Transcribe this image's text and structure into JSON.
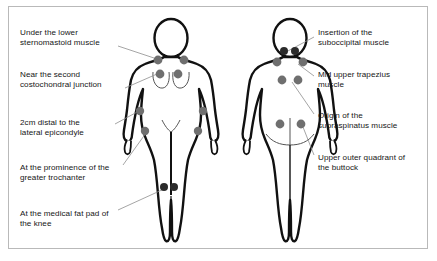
{
  "diagram": {
    "type": "anatomical-tender-point-map",
    "colors": {
      "background": "#ffffff",
      "border": "#b9b9b9",
      "body_outline": "#111111",
      "body_fill": "#ffffff",
      "inner_contour": "#555555",
      "tender_point_gray": "#6f6f6f",
      "tender_point_dark": "#2b2b2b",
      "leader_line": "#8e8e8e",
      "text": "#161616"
    },
    "figures": [
      {
        "name": "front-view-female-body",
        "view": "anterior",
        "cx": 171,
        "label_side": "left"
      },
      {
        "name": "back-view-female-body",
        "view": "posterior",
        "cx": 290,
        "label_side": "right"
      }
    ],
    "left_labels": [
      {
        "id": "sternomastoid",
        "text": "Under the lower\nsternomastoid muscle",
        "x": 20,
        "y": 28,
        "leader": [
          [
            118,
            46
          ],
          [
            157,
            59
          ]
        ]
      },
      {
        "id": "costochondral",
        "text": "Near the second\ncostochondral junction",
        "x": 20,
        "y": 70,
        "leader": [
          [
            125,
            88
          ],
          [
            157,
            74
          ]
        ]
      },
      {
        "id": "lateral-epicondyle",
        "text": "2cm distal to the\nlateral epicondyle",
        "x": 20,
        "y": 118,
        "leader": [
          [
            115,
            124
          ],
          [
            139,
            111
          ]
        ]
      },
      {
        "id": "greater-trochanter",
        "text": "At the prominence of the\ngreater trochanter",
        "x": 20,
        "y": 163,
        "leader": [
          [
            123,
            165
          ],
          [
            146,
            133
          ]
        ]
      },
      {
        "id": "medial-fat-pad-knee",
        "text": "At the medical fat pad of\nthe knee",
        "x": 20,
        "y": 209,
        "leader": [
          [
            118,
            210
          ],
          [
            164,
            188
          ]
        ]
      }
    ],
    "right_labels": [
      {
        "id": "suboccipital",
        "text": "Insertion of the\nsuboccipital muscle",
        "x": 318,
        "y": 28,
        "leader": [
          [
            314,
            37
          ],
          [
            285,
            52
          ]
        ]
      },
      {
        "id": "mid-upper-trapezius",
        "text": "Mid upper trapezius\nmuscle",
        "x": 318,
        "y": 70,
        "leader": [
          [
            314,
            76
          ],
          [
            297,
            63
          ]
        ]
      },
      {
        "id": "supraspinatus",
        "text": "Origin of the\nsupraspinatus muscle",
        "x": 318,
        "y": 111,
        "leader": [
          [
            314,
            114
          ],
          [
            291,
            81
          ]
        ]
      },
      {
        "id": "upper-outer-buttock",
        "text": "Upper outer quadrant of\nthe buttock",
        "x": 318,
        "y": 153,
        "leader": [
          [
            314,
            155
          ],
          [
            302,
            126
          ]
        ]
      }
    ],
    "tender_points": {
      "front": [
        {
          "id": "sternomastoid-left",
          "x": 158,
          "y": 60,
          "r": 4.4,
          "shade": "gray"
        },
        {
          "id": "sternomastoid-right",
          "x": 184,
          "y": 60,
          "r": 4.4,
          "shade": "gray"
        },
        {
          "id": "costochondral-left",
          "x": 160,
          "y": 74,
          "r": 4.4,
          "shade": "gray"
        },
        {
          "id": "costochondral-right",
          "x": 178,
          "y": 74,
          "r": 4.4,
          "shade": "gray"
        },
        {
          "id": "epicondyle-left",
          "x": 140,
          "y": 111,
          "r": 4.2,
          "shade": "gray"
        },
        {
          "id": "epicondyle-right",
          "x": 203,
          "y": 111,
          "r": 4.2,
          "shade": "gray"
        },
        {
          "id": "trochanter-left",
          "x": 145,
          "y": 131,
          "r": 4.2,
          "shade": "gray"
        },
        {
          "id": "trochanter-right",
          "x": 198,
          "y": 131,
          "r": 4.2,
          "shade": "gray"
        },
        {
          "id": "knee-fat-pad-left",
          "x": 164,
          "y": 187,
          "r": 4.0,
          "shade": "dark"
        },
        {
          "id": "knee-fat-pad-right",
          "x": 174,
          "y": 187,
          "r": 4.0,
          "shade": "dark"
        }
      ],
      "back": [
        {
          "id": "suboccipital-left",
          "x": 284,
          "y": 51,
          "r": 4.0,
          "shade": "dark"
        },
        {
          "id": "suboccipital-right",
          "x": 295,
          "y": 51,
          "r": 4.0,
          "shade": "dark"
        },
        {
          "id": "trapezius-left",
          "x": 277,
          "y": 62,
          "r": 4.4,
          "shade": "gray"
        },
        {
          "id": "trapezius-right",
          "x": 303,
          "y": 62,
          "r": 4.4,
          "shade": "gray"
        },
        {
          "id": "supraspinatus-left",
          "x": 282,
          "y": 80,
          "r": 4.4,
          "shade": "gray"
        },
        {
          "id": "supraspinatus-right",
          "x": 298,
          "y": 80,
          "r": 4.4,
          "shade": "gray"
        },
        {
          "id": "buttock-left",
          "x": 280,
          "y": 124,
          "r": 4.4,
          "shade": "gray"
        },
        {
          "id": "buttock-right",
          "x": 301,
          "y": 124,
          "r": 4.4,
          "shade": "gray"
        }
      ]
    }
  }
}
